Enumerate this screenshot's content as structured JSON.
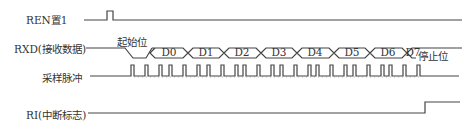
{
  "signals": {
    "ren": {
      "label": "REN置1"
    },
    "rxd": {
      "label": "RXD(接收数据)"
    },
    "sample": {
      "label": "采样脉冲"
    },
    "ri": {
      "label": "RI(中断标志)"
    }
  },
  "annotations": {
    "start_bit": "起始位",
    "stop_bit": "停止位"
  },
  "data_bits": [
    "D0",
    "D1",
    "D2",
    "D3",
    "D4",
    "D5",
    "D6",
    "D7"
  ],
  "colors": {
    "line": "#444444",
    "dotted": "#888888"
  }
}
